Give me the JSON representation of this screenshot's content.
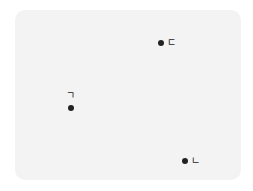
{
  "diagram": {
    "background": "#f3f3f3",
    "dot_color": "#222222",
    "points": [
      {
        "label": "ㄱ",
        "x": 71,
        "y": 108
      },
      {
        "label": "ㄴ",
        "x": 185,
        "y": 161
      },
      {
        "label": "ㄷ",
        "x": 161,
        "y": 43
      }
    ]
  }
}
